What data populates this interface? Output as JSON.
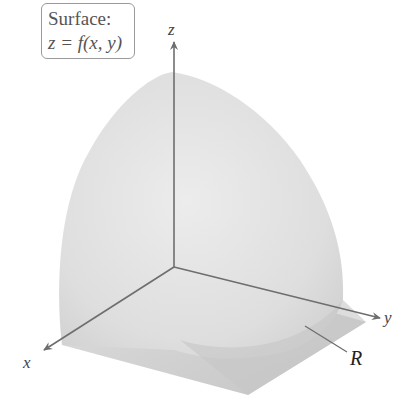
{
  "figure": {
    "caption_box": {
      "line1": "Surface:",
      "line2": "z = f(x, y)"
    },
    "axes": {
      "x_label": "x",
      "y_label": "y",
      "z_label": "z"
    },
    "region_label": "R",
    "colors": {
      "surface": "#dcdcdc",
      "region": "#c8c8c8",
      "axis": "#6e6e6e",
      "label_box_border": "#9a9a9a"
    }
  }
}
